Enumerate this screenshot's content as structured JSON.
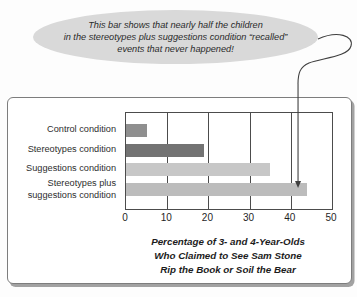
{
  "callout": {
    "background": "#d9d9d9",
    "lines": [
      "This bar shows that nearly half the children",
      "in the stereotypes plus suggestions condition “recalled”",
      "events that never happened!"
    ]
  },
  "chart_data": {
    "type": "bar",
    "orientation": "horizontal",
    "categories": [
      "Control condition",
      "Stereotypes condition",
      "Suggestions condition",
      "Stereotypes plus suggestions condition"
    ],
    "values": [
      5,
      19,
      35,
      44
    ],
    "bar_colors": [
      "#8f8f8f",
      "#737373",
      "#c7c7c7",
      "#bcbcbc"
    ],
    "xlim": [
      0,
      50
    ],
    "x_ticks": [
      0,
      10,
      20,
      30,
      40,
      50
    ],
    "xlabel_lines": [
      "Percentage of 3- and 4-Year-Olds",
      "Who Claimed to See Sam Stone",
      "Rip the Book or Soil the Bear"
    ],
    "grid": true,
    "legend": false,
    "annotation": {
      "text": "This bar shows that nearly half the children in the stereotypes plus suggestions condition “recalled” events that never happened!",
      "points_to_category": "Stereotypes plus suggestions condition",
      "points_to_value": 42,
      "line_color": "#3f3f3f"
    }
  }
}
